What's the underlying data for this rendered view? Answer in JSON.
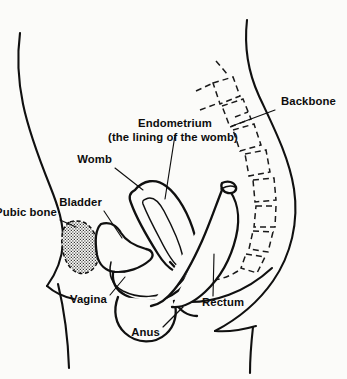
{
  "figure": {
    "background_color": "#fbfbf9",
    "line_color": "#101010",
    "style": "black-and-white line diagram"
  },
  "labels": {
    "backbone": "Backbone",
    "endometrium_line1": "Endometrium",
    "endometrium_line2": "(the lining of the womb)",
    "womb": "Womb",
    "bladder": "Bladder",
    "pubic_bone": "Pubic bone",
    "vagina": "Vagina",
    "anus": "Anus",
    "rectum": "Rectum"
  },
  "structures": [
    {
      "name": "backbone",
      "label": "Backbone",
      "rendering": "dashed vertebrae chain"
    },
    {
      "name": "endometrium",
      "label": "Endometrium (the lining of the womb)",
      "rendering": "inner cavity outline of womb"
    },
    {
      "name": "womb",
      "label": "Womb",
      "rendering": "solid elongated oval"
    },
    {
      "name": "bladder",
      "label": "Bladder",
      "rendering": "solid wedge outline"
    },
    {
      "name": "pubic-bone",
      "label": "Pubic bone",
      "rendering": "stippled teardrop with dashed outline"
    },
    {
      "name": "vagina",
      "label": "Vagina",
      "rendering": "solid canal outline"
    },
    {
      "name": "anus",
      "label": "Anus",
      "rendering": "solid opening outline"
    },
    {
      "name": "rectum",
      "label": "Rectum",
      "rendering": "solid curved tube with open cut end"
    }
  ]
}
